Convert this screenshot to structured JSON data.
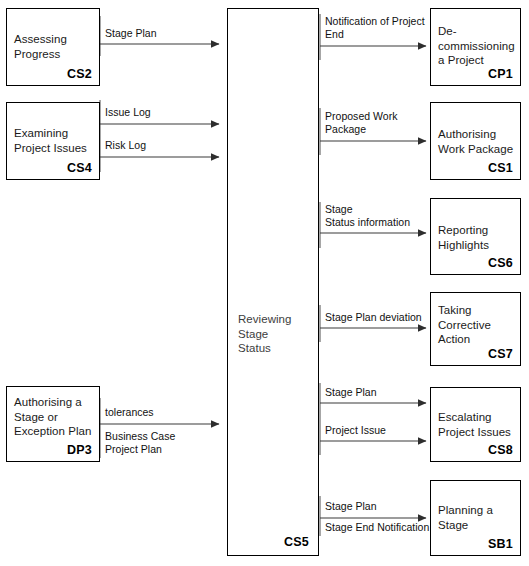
{
  "diagram": {
    "line_color": "#3a3a3a",
    "box_border_color": "#000000",
    "background": "#ffffff"
  },
  "hub": {
    "title_line_1": "Reviewing",
    "title_line_2": "Stage",
    "title_line_3": "Status",
    "code": "CS5"
  },
  "inputs": [
    {
      "id": "cs2",
      "title_line_1": "Assessing",
      "title_line_2": "Progress",
      "code": "CS2",
      "labels": [
        "Stage Plan"
      ]
    },
    {
      "id": "cs4",
      "title_line_1": "Examining",
      "title_line_2": "Project Issues",
      "code": "CS4",
      "labels": [
        "Issue Log",
        "Risk Log"
      ]
    },
    {
      "id": "dp3",
      "title_line_1": "Authorising a",
      "title_line_2": "Stage or",
      "title_line_3": "Exception Plan",
      "code": "DP3",
      "labels": [
        "tolerances",
        "Business Case",
        "Project Plan"
      ]
    }
  ],
  "outputs": [
    {
      "id": "cp1",
      "title_line_1": "De-",
      "title_line_2": "commissioning",
      "title_line_3": "a Project",
      "code": "CP1",
      "labels": [
        "Notification of Project",
        "End"
      ]
    },
    {
      "id": "cs1",
      "title_line_1": "Authorising",
      "title_line_2": "Work Package",
      "code": "CS1",
      "labels": [
        "Proposed Work",
        "Package"
      ]
    },
    {
      "id": "cs6",
      "title_line_1": "Reporting",
      "title_line_2": "Highlights",
      "code": "CS6",
      "labels": [
        "Stage",
        "Status information"
      ]
    },
    {
      "id": "cs7",
      "title_line_1": "Taking",
      "title_line_2": "Corrective",
      "title_line_3": "Action",
      "code": "CS7",
      "labels": [
        "Stage Plan deviation"
      ]
    },
    {
      "id": "cs8",
      "title_line_1": "Escalating",
      "title_line_2": "Project Issues",
      "code": "CS8",
      "labels": [
        "Stage Plan",
        "Project Issue"
      ]
    },
    {
      "id": "sb1",
      "title_line_1": "Planning a",
      "title_line_2": "Stage",
      "code": "SB1",
      "labels": [
        "Stage Plan",
        "Stage End Notification"
      ]
    }
  ]
}
